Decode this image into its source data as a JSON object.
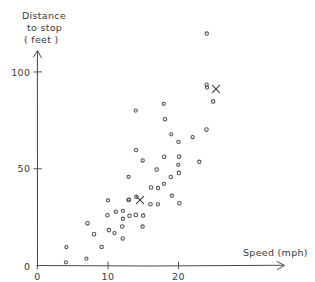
{
  "chart_data": {
    "type": "scatter",
    "title": "",
    "xlabel": "Speed (mph)",
    "ylabel_lines": [
      "Distance",
      "to stop",
      "( feet )"
    ],
    "ylabel": "Distance to stop (feet)",
    "xlim": [
      0,
      27
    ],
    "ylim": [
      0,
      125
    ],
    "xticks": [
      0,
      10,
      20
    ],
    "xticklabels": [
      "0",
      "10",
      "20"
    ],
    "yticks": [
      0,
      50,
      100
    ],
    "yticklabels": [
      "0",
      "50",
      "100"
    ],
    "grid": false,
    "legend": "none",
    "marker": "open-circle",
    "style": "hand-drawn",
    "x": [
      4,
      4,
      7,
      7,
      8,
      9,
      10,
      10,
      10,
      11,
      11,
      12,
      12,
      12,
      12,
      13,
      13,
      13,
      13,
      14,
      14,
      14,
      14,
      15,
      15,
      15,
      16,
      16,
      17,
      17,
      17,
      18,
      18,
      18,
      18,
      19,
      19,
      19,
      20,
      20,
      20,
      20,
      20,
      22,
      23,
      24,
      24,
      24,
      24,
      25
    ],
    "y": [
      2,
      10,
      4,
      22,
      16,
      10,
      18,
      26,
      34,
      17,
      28,
      14,
      20,
      24,
      28,
      26,
      34,
      34,
      46,
      26,
      36,
      60,
      80,
      20,
      26,
      54,
      32,
      40,
      32,
      40,
      50,
      42,
      56,
      76,
      84,
      36,
      46,
      68,
      32,
      48,
      52,
      56,
      64,
      66,
      54,
      70,
      92,
      93,
      120,
      85
    ],
    "annotations": [
      {
        "label": "X",
        "x": 14.4,
        "y": 34,
        "px": 140,
        "py": 200
      },
      {
        "label": "X",
        "x": 23.5,
        "y": 90,
        "px": 216,
        "py": 89
      }
    ],
    "n_points": 50
  },
  "axes": {
    "x_axis_name": "speed-axis",
    "y_axis_name": "distance-axis",
    "x_title": "Speed (mph)",
    "y_title_line1": "Distance",
    "y_title_line2": "to stop",
    "y_title_line3": "( feet )"
  },
  "ticks": {
    "x": [
      {
        "label": "0",
        "value": 0
      },
      {
        "label": "10",
        "value": 10
      },
      {
        "label": "20",
        "value": 20
      }
    ],
    "y": [
      {
        "label": "0",
        "value": 0
      },
      {
        "label": "50",
        "value": 50
      },
      {
        "label": "100",
        "value": 100
      }
    ]
  },
  "colors": {
    "background": "#ffffff",
    "axis": "#4a4a4a",
    "point": "#4f4f52",
    "text": "#3a3a3a",
    "marker_x": "#3f3f42"
  }
}
